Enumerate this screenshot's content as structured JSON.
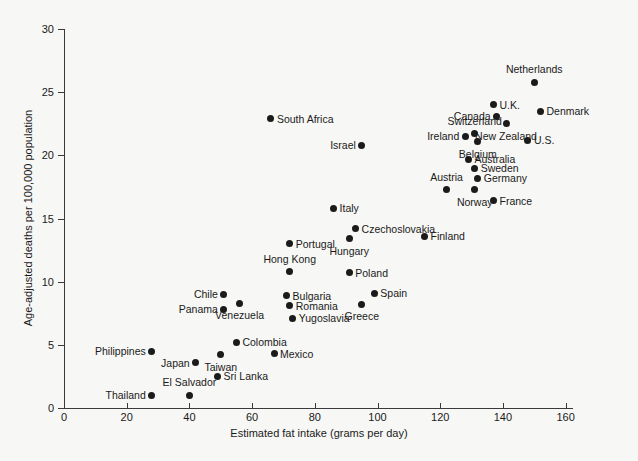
{
  "chart_data": {
    "type": "scatter",
    "title": "",
    "xlabel": "Estimated fat intake (grams per day)",
    "ylabel": "Age-adjusted deaths per 100,000 population",
    "xlim": [
      0,
      163
    ],
    "ylim": [
      0,
      30
    ],
    "xticks": [
      0,
      20,
      40,
      60,
      80,
      100,
      120,
      140,
      160
    ],
    "yticks": [
      0,
      5,
      10,
      15,
      20,
      25,
      30
    ],
    "grid": false,
    "legend": "none",
    "marker_color": "#1b1b1b",
    "points": [
      {
        "label": "Thailand",
        "x": 28,
        "y": 1.0,
        "pos": "left"
      },
      {
        "label": "El Salvador",
        "x": 40,
        "y": 1.0,
        "pos": "above"
      },
      {
        "label": "Sri Lanka",
        "x": 49,
        "y": 2.5,
        "pos": "right"
      },
      {
        "label": "Philippines",
        "x": 28,
        "y": 4.5,
        "pos": "left"
      },
      {
        "label": "Japan",
        "x": 42,
        "y": 3.6,
        "pos": "left"
      },
      {
        "label": "Taiwan",
        "x": 50,
        "y": 4.2,
        "pos": "below"
      },
      {
        "label": "Colombia",
        "x": 55,
        "y": 5.2,
        "pos": "right"
      },
      {
        "label": "Mexico",
        "x": 67,
        "y": 4.3,
        "pos": "right"
      },
      {
        "label": "Chile",
        "x": 51,
        "y": 9.0,
        "pos": "left"
      },
      {
        "label": "Panama",
        "x": 51,
        "y": 7.8,
        "pos": "left"
      },
      {
        "label": "Venezuela",
        "x": 56,
        "y": 8.3,
        "pos": "below"
      },
      {
        "label": "Bulgaria",
        "x": 71,
        "y": 8.9,
        "pos": "right"
      },
      {
        "label": "Romania",
        "x": 72,
        "y": 8.1,
        "pos": "right"
      },
      {
        "label": "Yugoslavia",
        "x": 73,
        "y": 7.1,
        "pos": "right"
      },
      {
        "label": "Hong Kong",
        "x": 72,
        "y": 10.8,
        "pos": "above"
      },
      {
        "label": "Portugal",
        "x": 72,
        "y": 13.0,
        "pos": "right"
      },
      {
        "label": "Poland",
        "x": 91,
        "y": 10.7,
        "pos": "right"
      },
      {
        "label": "Greece",
        "x": 95,
        "y": 8.2,
        "pos": "below"
      },
      {
        "label": "Spain",
        "x": 99,
        "y": 9.1,
        "pos": "right"
      },
      {
        "label": "Italy",
        "x": 86,
        "y": 15.8,
        "pos": "right"
      },
      {
        "label": "Hungary",
        "x": 91,
        "y": 13.4,
        "pos": "below"
      },
      {
        "label": "Czechoslovakia",
        "x": 93,
        "y": 14.2,
        "pos": "right"
      },
      {
        "label": "Finland",
        "x": 115,
        "y": 13.6,
        "pos": "right"
      },
      {
        "label": "Israel",
        "x": 95,
        "y": 20.8,
        "pos": "left"
      },
      {
        "label": "South Africa",
        "x": 66,
        "y": 22.9,
        "pos": "right"
      },
      {
        "label": "Austria",
        "x": 122,
        "y": 17.3,
        "pos": "above"
      },
      {
        "label": "Norway",
        "x": 131,
        "y": 17.3,
        "pos": "below"
      },
      {
        "label": "France",
        "x": 137,
        "y": 16.4,
        "pos": "right"
      },
      {
        "label": "Germany",
        "x": 132,
        "y": 18.2,
        "pos": "right"
      },
      {
        "label": "Sweden",
        "x": 131,
        "y": 19.0,
        "pos": "right"
      },
      {
        "label": "Australia",
        "x": 129,
        "y": 19.7,
        "pos": "right"
      },
      {
        "label": "Belgium",
        "x": 132,
        "y": 21.1,
        "pos": "below"
      },
      {
        "label": "Ireland",
        "x": 128,
        "y": 21.5,
        "pos": "left"
      },
      {
        "label": "U.S.",
        "x": 148,
        "y": 21.2,
        "pos": "right"
      },
      {
        "label": "Switzerland",
        "x": 131,
        "y": 21.7,
        "pos": "above"
      },
      {
        "label": "New Zealand",
        "x": 141,
        "y": 22.5,
        "pos": "below"
      },
      {
        "label": "Canada",
        "x": 138,
        "y": 23.1,
        "pos": "left"
      },
      {
        "label": "U.K.",
        "x": 137,
        "y": 24.0,
        "pos": "right"
      },
      {
        "label": "Denmark",
        "x": 152,
        "y": 23.5,
        "pos": "right"
      },
      {
        "label": "Netherlands",
        "x": 150,
        "y": 25.8,
        "pos": "above"
      }
    ]
  }
}
